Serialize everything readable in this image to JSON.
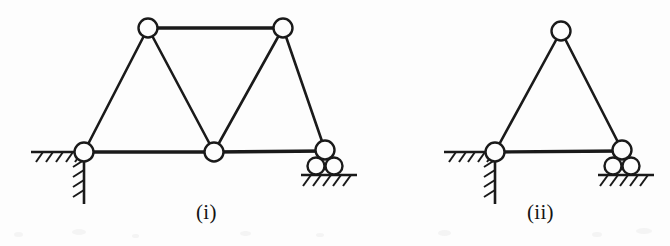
{
  "page": {
    "background_color": "#fdfdfd",
    "ink_color": "#1a1a1a",
    "width": 670,
    "height": 246
  },
  "figures": [
    {
      "key": "i",
      "label": "(i)",
      "caption_label": "(i)",
      "description": "Five-joint truss on a pin support at left and a roller support at right",
      "joints": [
        {
          "name": "pin-support-joint",
          "x": 84,
          "y": 152,
          "r": 9.5
        },
        {
          "name": "bottom-mid-joint",
          "x": 214,
          "y": 152,
          "r": 9.5
        },
        {
          "name": "roller-support-joint",
          "x": 325,
          "y": 150,
          "r": 9.5
        },
        {
          "name": "top-left-joint",
          "x": 148,
          "y": 28,
          "r": 9.5
        },
        {
          "name": "top-right-joint",
          "x": 283,
          "y": 28,
          "r": 9.5
        }
      ],
      "members": [
        {
          "name": "top-chord",
          "from": "top-left-joint",
          "to": "top-right-joint",
          "weight": "heavy"
        },
        {
          "name": "bottom-chord-left",
          "from": "pin-support-joint",
          "to": "bottom-mid-joint",
          "weight": "heavy"
        },
        {
          "name": "bottom-chord-right",
          "from": "bottom-mid-joint",
          "to": "roller-support-joint",
          "weight": "heavy"
        },
        {
          "name": "left-diagonal",
          "from": "pin-support-joint",
          "to": "top-left-joint",
          "weight": "normal"
        },
        {
          "name": "left-inner-diagonal",
          "from": "top-left-joint",
          "to": "bottom-mid-joint",
          "weight": "normal"
        },
        {
          "name": "right-inner-diagonal",
          "from": "bottom-mid-joint",
          "to": "top-right-joint",
          "weight": "normal"
        },
        {
          "name": "right-diagonal",
          "from": "top-right-joint",
          "to": "roller-support-joint",
          "weight": "normal"
        }
      ],
      "supports": [
        {
          "name": "pin-support",
          "type": "pin",
          "at": "pin-support-joint"
        },
        {
          "name": "roller-support",
          "type": "roller",
          "at": "roller-support-joint",
          "rollers": 2
        }
      ]
    },
    {
      "key": "ii",
      "label": "(ii)",
      "caption_label": "(ii)",
      "description": "Three-joint triangular truss on a pin support at left and a roller support at right",
      "joints": [
        {
          "name": "pin-support-joint",
          "x": 495,
          "y": 152,
          "r": 9.5
        },
        {
          "name": "apex-joint",
          "x": 561,
          "y": 31,
          "r": 9.5
        },
        {
          "name": "roller-support-joint",
          "x": 622,
          "y": 150,
          "r": 9.5
        }
      ],
      "members": [
        {
          "name": "bottom-chord",
          "from": "pin-support-joint",
          "to": "roller-support-joint",
          "weight": "heavy"
        },
        {
          "name": "left-rafter",
          "from": "pin-support-joint",
          "to": "apex-joint",
          "weight": "normal"
        },
        {
          "name": "right-rafter",
          "from": "apex-joint",
          "to": "roller-support-joint",
          "weight": "normal"
        }
      ],
      "supports": [
        {
          "name": "pin-support",
          "type": "pin",
          "at": "pin-support-joint"
        },
        {
          "name": "roller-support",
          "type": "roller",
          "at": "roller-support-joint",
          "rollers": 2
        }
      ]
    }
  ]
}
